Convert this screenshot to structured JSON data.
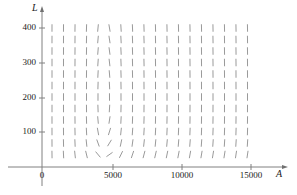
{
  "figure": {
    "type": "direction-field",
    "background_color": "#ffffff",
    "axis_color": "#808080",
    "field_color": "#9a9a9a",
    "text_color": "#1a1a1a"
  },
  "axes": {
    "x": {
      "label": "A",
      "label_style": "italic",
      "ticks": [
        {
          "value": 5000,
          "label": "5000"
        },
        {
          "value": 10000,
          "label": "10000"
        },
        {
          "value": 15000,
          "label": "15000"
        }
      ],
      "origin_label": "0",
      "range": [
        0,
        16800
      ],
      "arrow": true
    },
    "y": {
      "label": "L",
      "label_style": "italic",
      "ticks": [
        {
          "value": 100,
          "label": "100"
        },
        {
          "value": 200,
          "label": "200"
        },
        {
          "value": 300,
          "label": "300"
        },
        {
          "value": 400,
          "label": "400"
        }
      ],
      "range": [
        0,
        460
      ],
      "arrow": true
    }
  },
  "chart_data": {
    "type": "scatter",
    "title": "",
    "xlabel": "A",
    "ylabel": "L",
    "xlim": [
      0,
      16800
    ],
    "ylim": [
      0,
      460
    ],
    "grid": false,
    "legend": null,
    "plot_pixel_box": {
      "left": 42,
      "top": 167,
      "right": 285,
      "bottom": 167
    },
    "field": {
      "description": "Predator-prey (Lotka-Volterra style) slope field dL/dA with closed orbits circulating counter-clockwise about an equilibrium center.",
      "equilibrium": {
        "A": 4400,
        "L": 200
      },
      "rotation": "counter-clockwise",
      "grid_x_start_px": 52,
      "grid_y_start_px": 28,
      "grid_step_px": 11.5,
      "grid_cols": 18,
      "grid_rows": 12,
      "dash_length_px": 7.5,
      "dash_width_px": 1.0,
      "model": {
        "dA_dt_scale": 1.0,
        "dL_dt_scale": 1.0,
        "note": "slope = (k2*(A-Ae)*L) / (k1*(Le-L)*A) evaluated on grid"
      }
    }
  },
  "layout": {
    "width": 297,
    "height": 195,
    "x_axis_y_px": 167,
    "y_axis_x_px": 42,
    "x_tick_px": {
      "5000": 113,
      "10000": 182,
      "15000": 251
    },
    "y_tick_px": {
      "100": 132,
      "200": 98,
      "300": 63,
      "400": 28
    }
  }
}
